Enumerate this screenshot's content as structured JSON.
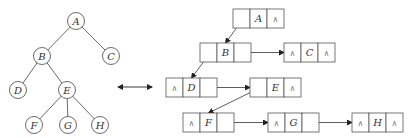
{
  "tree": {
    "nodes": [
      {
        "id": "A",
        "label": "A",
        "x": 76,
        "y": 21
      },
      {
        "id": "B",
        "label": "B",
        "x": 42,
        "y": 56
      },
      {
        "id": "C",
        "label": "C",
        "x": 111,
        "y": 56
      },
      {
        "id": "D",
        "label": "D",
        "x": 18,
        "y": 90
      },
      {
        "id": "E",
        "label": "E",
        "x": 67,
        "y": 90
      },
      {
        "id": "F",
        "label": "F",
        "x": 34,
        "y": 125
      },
      {
        "id": "G",
        "label": "G",
        "x": 68,
        "y": 125
      },
      {
        "id": "H",
        "label": "H",
        "x": 100,
        "y": 125
      }
    ],
    "edges": [
      [
        "A",
        "B"
      ],
      [
        "A",
        "C"
      ],
      [
        "B",
        "D"
      ],
      [
        "B",
        "E"
      ],
      [
        "E",
        "F"
      ],
      [
        "E",
        "G"
      ],
      [
        "E",
        "H"
      ]
    ]
  },
  "equivalence_arrow": {
    "symbol": "↔"
  },
  "linked_representation": {
    "nodes": [
      {
        "id": "A",
        "left": "",
        "data": "A",
        "right": "∧",
        "x": 233,
        "y": 9
      },
      {
        "id": "B",
        "left": "",
        "data": "B",
        "right": "",
        "x": 200,
        "y": 43
      },
      {
        "id": "C",
        "left": "∧",
        "data": "C",
        "right": "∧",
        "x": 284,
        "y": 43
      },
      {
        "id": "D",
        "left": "∧",
        "data": "D",
        "right": "",
        "x": 166,
        "y": 78
      },
      {
        "id": "E",
        "left": "",
        "data": "E",
        "right": "∧",
        "x": 250,
        "y": 78
      },
      {
        "id": "F",
        "left": "∧",
        "data": "F",
        "right": "",
        "x": 183,
        "y": 113
      },
      {
        "id": "G",
        "left": "∧",
        "data": "G",
        "right": "",
        "x": 268,
        "y": 113
      },
      {
        "id": "H",
        "left": "∧",
        "data": "H",
        "right": "∧",
        "x": 352,
        "y": 113
      }
    ],
    "pointers": [
      {
        "from": "A",
        "field": "left",
        "to": "B"
      },
      {
        "from": "B",
        "field": "left",
        "to": "D"
      },
      {
        "from": "B",
        "field": "right",
        "to": "C"
      },
      {
        "from": "D",
        "field": "right",
        "to": "E"
      },
      {
        "from": "E",
        "field": "left",
        "to": "F"
      },
      {
        "from": "F",
        "field": "right",
        "to": "G"
      },
      {
        "from": "G",
        "field": "right",
        "to": "H"
      }
    ]
  }
}
